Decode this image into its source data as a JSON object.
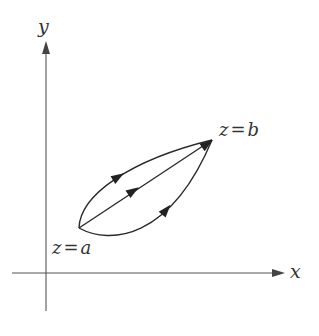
{
  "diagram": {
    "axes": {
      "x_label": "x",
      "y_label": "y"
    },
    "points": {
      "start": {
        "label": "z = a",
        "var": "z",
        "eq": "=",
        "value": "a"
      },
      "end": {
        "label": "z = b",
        "var": "z",
        "eq": "=",
        "value": "b"
      }
    },
    "paths": [
      {
        "name": "upper-curve",
        "direction": "a to b"
      },
      {
        "name": "straight-line",
        "direction": "a to b"
      },
      {
        "name": "lower-curve",
        "direction": "a to b"
      }
    ],
    "colors": {
      "stroke": "#2a2a2a",
      "axis": "#555555"
    }
  }
}
